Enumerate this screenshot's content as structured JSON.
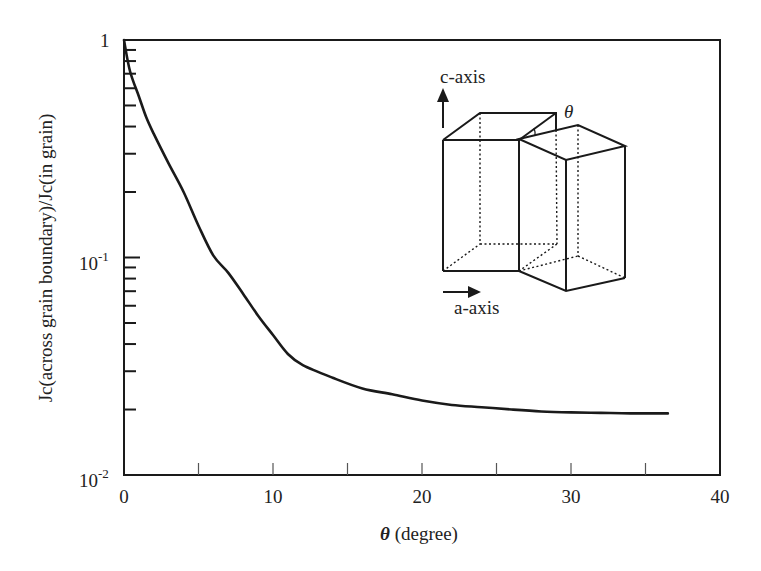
{
  "chart_data": {
    "type": "line",
    "title": "",
    "xlabel": "θ (degree)",
    "ylabel": "Jc(across grain boundary)/Jc(in grain)",
    "xlim": [
      0,
      40
    ],
    "ylim": [
      0.01,
      1
    ],
    "yscale": "log",
    "grid": false,
    "legend": null,
    "x_ticks": [
      0,
      10,
      20,
      30,
      40
    ],
    "x_tick_labels": [
      "0",
      "10",
      "20",
      "30",
      "40"
    ],
    "x_minor_ticks": [
      5,
      15,
      25,
      35
    ],
    "y_ticks": [
      0.01,
      0.1,
      1
    ],
    "y_tick_labels": [
      {
        "base": "10",
        "exp": "-2"
      },
      {
        "base": "10",
        "exp": "-1"
      },
      {
        "base": "1",
        "exp": ""
      }
    ],
    "series": [
      {
        "name": "Jc ratio",
        "color": "#1a1a1a",
        "x": [
          0,
          0.4,
          1,
          1.5,
          2,
          3,
          4,
          5,
          6,
          7,
          8,
          9,
          10,
          11,
          12,
          14,
          16,
          18,
          20,
          22,
          24,
          26,
          28,
          30,
          32,
          34,
          36.5
        ],
        "y": [
          1.0,
          0.72,
          0.55,
          0.44,
          0.37,
          0.27,
          0.2,
          0.14,
          0.102,
          0.085,
          0.068,
          0.054,
          0.044,
          0.036,
          0.032,
          0.028,
          0.025,
          0.0235,
          0.022,
          0.021,
          0.0205,
          0.02,
          0.0196,
          0.0194,
          0.0193,
          0.0192,
          0.0192
        ]
      }
    ],
    "annotations": [
      {
        "type": "inset-diagram",
        "description": "Two tilted rectangular grains with misorientation angle θ",
        "labels": [
          "c-axis",
          "a-axis",
          "θ"
        ]
      }
    ]
  },
  "axes": {
    "x_title_symbol": "θ",
    "x_title_text": " (degree)",
    "y_title": "Jc(across grain boundary)/Jc(in grain)",
    "x_labels": [
      "0",
      "10",
      "20",
      "30",
      "40"
    ],
    "y_label_1": "1",
    "y_label_m1_base": "10",
    "y_label_m1_exp": "-1",
    "y_label_m2_base": "10",
    "y_label_m2_exp": "-2"
  },
  "inset": {
    "c_axis_label": "c-axis",
    "a_axis_label": "a-axis",
    "theta_label": "θ"
  }
}
